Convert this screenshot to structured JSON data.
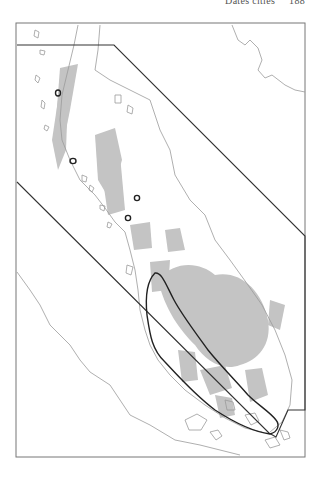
{
  "header": {
    "running_title": "Dates cities",
    "page_number": "188"
  },
  "map": {
    "frame": {
      "x": 16,
      "y": 23,
      "width": 289,
      "height": 434,
      "stroke": "#777777"
    },
    "colors": {
      "land_outline": "#9a9a9a",
      "highland_fill": "#c4c4c4",
      "boundary_line": "#333333",
      "region_outline": "#222222",
      "marker": "#222222"
    },
    "site_markers": [
      {
        "id": "site-1",
        "x": 58,
        "y": 93
      },
      {
        "id": "site-2",
        "x": 73,
        "y": 161
      },
      {
        "id": "site-3",
        "x": 137,
        "y": 198
      },
      {
        "id": "site-4",
        "x": 128,
        "y": 218
      },
      {
        "id": "site-5",
        "x": 274,
        "y": 428
      }
    ]
  }
}
